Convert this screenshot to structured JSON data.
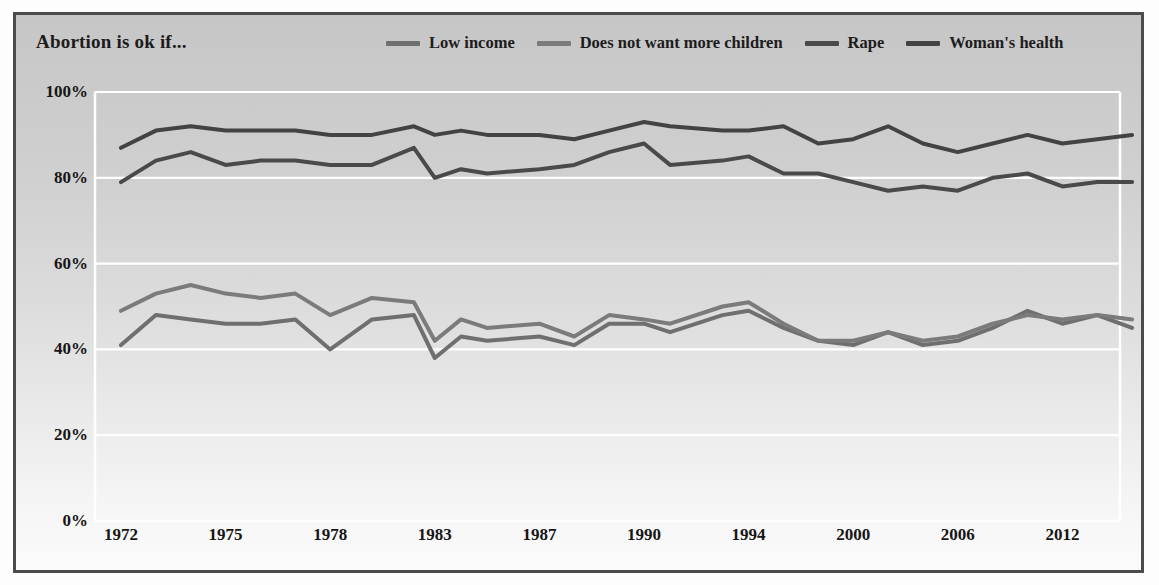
{
  "chart_data": {
    "type": "line",
    "title": "Abortion is ok if...",
    "xlabel": "",
    "ylabel": "",
    "ylim": [
      0,
      100
    ],
    "ytick_labels": [
      "100%",
      "80%",
      "60%",
      "40%",
      "20%",
      "0%"
    ],
    "ytick_values": [
      100,
      80,
      60,
      40,
      20,
      0
    ],
    "grid": "horizontal",
    "legend_position": "top",
    "axis_type": "categorical-years",
    "categories": [
      1972,
      1973,
      1974,
      1975,
      1976,
      1977,
      1978,
      1980,
      1982,
      1983,
      1984,
      1985,
      1987,
      1988,
      1989,
      1990,
      1991,
      1993,
      1994,
      1996,
      1998,
      2000,
      2002,
      2004,
      2006,
      2008,
      2010,
      2012,
      2014,
      2016
    ],
    "xtick_labels": [
      "1972",
      "1975",
      "1978",
      "1983",
      "1987",
      "1990",
      "1994",
      "2000",
      "2006",
      "2012"
    ],
    "xtick_categories": [
      1972,
      1975,
      1978,
      1983,
      1987,
      1990,
      1994,
      2000,
      2006,
      2012
    ],
    "series": [
      {
        "name": "Low income",
        "color": "#6f6f6f",
        "values": [
          41,
          48,
          47,
          46,
          46,
          47,
          40,
          47,
          48,
          38,
          43,
          42,
          43,
          41,
          46,
          46,
          44,
          48,
          49,
          45,
          42,
          41,
          44,
          41,
          42,
          45,
          49,
          46,
          48,
          45
        ]
      },
      {
        "name": "Does not want more children",
        "color": "#7b7b7b",
        "values": [
          49,
          53,
          55,
          53,
          52,
          53,
          48,
          52,
          51,
          42,
          47,
          45,
          46,
          43,
          48,
          47,
          46,
          50,
          51,
          46,
          42,
          42,
          44,
          42,
          43,
          46,
          48,
          47,
          48,
          47
        ]
      },
      {
        "name": "Rape",
        "color": "#4a4a4a",
        "values": [
          79,
          84,
          86,
          83,
          84,
          84,
          83,
          83,
          87,
          80,
          82,
          81,
          82,
          83,
          86,
          88,
          83,
          84,
          85,
          81,
          81,
          79,
          77,
          78,
          77,
          80,
          81,
          78,
          79,
          79
        ]
      },
      {
        "name": "Woman's health",
        "color": "#434343",
        "values": [
          87,
          91,
          92,
          91,
          91,
          91,
          90,
          90,
          92,
          90,
          91,
          90,
          90,
          89,
          91,
          93,
          92,
          91,
          91,
          92,
          88,
          89,
          92,
          88,
          86,
          88,
          90,
          88,
          89,
          90
        ]
      }
    ]
  },
  "style": {
    "gridline_color": "#ffffff",
    "axis_color": "#ffffff",
    "frame_color": "#4b4b4b",
    "text_color": "#1c1c1c",
    "panel_top_color": "#c6c6c6",
    "panel_bottom_color": "#fbfbfb"
  }
}
